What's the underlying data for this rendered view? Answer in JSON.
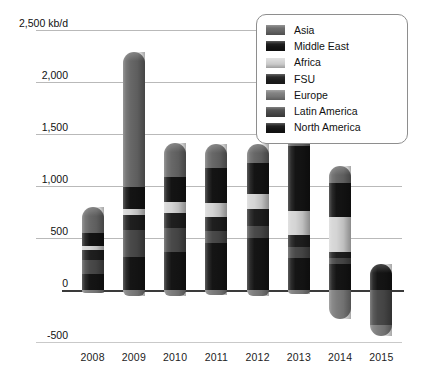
{
  "chart_data": {
    "type": "bar",
    "title": "",
    "subtitle": "",
    "xlabel": "",
    "ylabel": "",
    "unit_label": "kb/d",
    "stacked": true,
    "grid": true,
    "legend_position": "top-right",
    "categories": [
      "2008",
      "2009",
      "2010",
      "2011",
      "2012",
      "2013",
      "2014",
      "2015"
    ],
    "ylim": [
      -500,
      2500
    ],
    "yticks": [
      2500,
      2000,
      1500,
      1000,
      500,
      0,
      -500
    ],
    "ytick_labels": [
      "2,500 kb/d",
      "2,000",
      "1,500",
      "1,000",
      "500",
      "0",
      "-500"
    ],
    "series": [
      {
        "name": "North America",
        "color": "#151515",
        "values": [
          150,
          320,
          370,
          450,
          500,
          310,
          250,
          250
        ]
      },
      {
        "name": "Latin America",
        "color": "#4a4a4a",
        "values": [
          140,
          260,
          230,
          120,
          120,
          100,
          60,
          -340
        ]
      },
      {
        "name": "Europe",
        "color": "#7d7d7d",
        "values": [
          -30,
          -60,
          -60,
          -50,
          -60,
          -40,
          -280,
          -100
        ]
      },
      {
        "name": "FSU",
        "color": "#1f1f1f",
        "values": [
          90,
          140,
          140,
          130,
          160,
          120,
          60,
          0
        ]
      },
      {
        "name": "Africa",
        "color": "#d4d4d4",
        "values": [
          40,
          60,
          110,
          140,
          140,
          230,
          330,
          0
        ]
      },
      {
        "name": "Middle East",
        "color": "#141414",
        "values": [
          130,
          210,
          240,
          330,
          300,
          620,
          330,
          0
        ]
      },
      {
        "name": "Asia",
        "color": "#686868",
        "values": [
          250,
          1300,
          320,
          230,
          180,
          270,
          160,
          0
        ]
      }
    ]
  },
  "legend": {
    "items": [
      {
        "label": "Asia",
        "color": "#686868"
      },
      {
        "label": "Middle East",
        "color": "#141414"
      },
      {
        "label": "Africa",
        "color": "#d4d4d4"
      },
      {
        "label": "FSU",
        "color": "#1f1f1f"
      },
      {
        "label": "Europe",
        "color": "#7d7d7d"
      },
      {
        "label": "Latin America",
        "color": "#4a4a4a"
      },
      {
        "label": "North America",
        "color": "#151515"
      }
    ]
  }
}
